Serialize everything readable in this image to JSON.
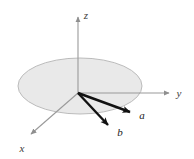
{
  "figure": {
    "background_color": "#ffffff",
    "width": 194,
    "height": 159
  },
  "plane_disk": {
    "name": "xy-plane",
    "fill_color": "#e9e9e9",
    "stroke_color": "#b4b4b4",
    "center": {
      "x": 80,
      "y": 86
    },
    "radius_x": 62,
    "radius_y": 28
  },
  "origin": {
    "x": 78,
    "y": 93
  },
  "axes": [
    {
      "id": "z",
      "label": "z",
      "color": "#9a9a9a",
      "label_color": "#3c3c3c",
      "tip": {
        "x": 78,
        "y": 13
      },
      "label_pos": {
        "x": 86,
        "y": 19
      }
    },
    {
      "id": "y",
      "label": "y",
      "color": "#9a9a9a",
      "label_color": "#3c3c3c",
      "tip": {
        "x": 173,
        "y": 93
      },
      "label_pos": {
        "x": 179,
        "y": 97
      }
    },
    {
      "id": "x",
      "label": "x",
      "color": "#9a9a9a",
      "label_color": "#3c3c3c",
      "tip": {
        "x": 27,
        "y": 138
      },
      "label_pos": {
        "x": 22,
        "y": 152
      }
    }
  ],
  "vectors": [
    {
      "id": "a",
      "label": "a",
      "color": "#111111",
      "from": {
        "x": 78,
        "y": 93
      },
      "to": {
        "x": 136,
        "y": 114
      },
      "label_pos": {
        "x": 142,
        "y": 119
      }
    },
    {
      "id": "b",
      "label": "b",
      "color": "#111111",
      "from": {
        "x": 78,
        "y": 93
      },
      "to": {
        "x": 113,
        "y": 130
      },
      "label_pos": {
        "x": 120,
        "y": 136
      }
    }
  ]
}
